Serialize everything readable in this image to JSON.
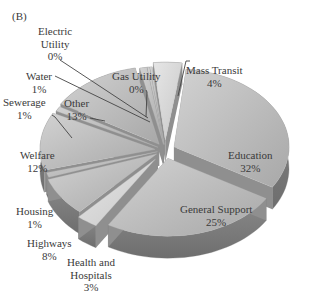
{
  "chart_data": {
    "type": "pie",
    "variant": "3d-exploded",
    "title": "",
    "panel_label": "(B)",
    "categories": [
      "Education",
      "General Support",
      "Health and Hospitals",
      "Highways",
      "Housing",
      "Welfare",
      "Sewerage",
      "Other",
      "Water",
      "Electric Utility",
      "Gas Utility",
      "Mass Transit"
    ],
    "values": [
      32,
      25,
      3,
      8,
      1,
      12,
      1,
      13,
      1,
      0,
      0,
      4
    ],
    "unit": "%",
    "legend": "none (direct labels)",
    "colors": {
      "top_light": "#c4c4c4",
      "top_dark": "#9a9a9a",
      "side": "#7d7d7d",
      "leader_line": "#444444"
    }
  },
  "labels": {
    "panel": "(B)",
    "education": {
      "name": "Education",
      "pct": "32%"
    },
    "general_support": {
      "name": "General Support",
      "pct": "25%"
    },
    "health": {
      "name1": "Health and",
      "name2": "Hospitals",
      "pct": "3%"
    },
    "highways": {
      "name": "Highways",
      "pct": "8%"
    },
    "housing": {
      "name": "Housing",
      "pct": "1%"
    },
    "welfare": {
      "name": "Welfare",
      "pct": "12%"
    },
    "sewerage": {
      "name": "Sewerage",
      "pct": "1%"
    },
    "other": {
      "name": "Other",
      "pct": "13%"
    },
    "water": {
      "name": "Water",
      "pct": "1%"
    },
    "electric": {
      "name1": "Electric",
      "name2": "Utility",
      "pct": "0%"
    },
    "gas": {
      "name": "Gas Utility",
      "pct": "0%"
    },
    "mass_transit": {
      "name": "Mass Transit",
      "pct": "4%"
    }
  }
}
